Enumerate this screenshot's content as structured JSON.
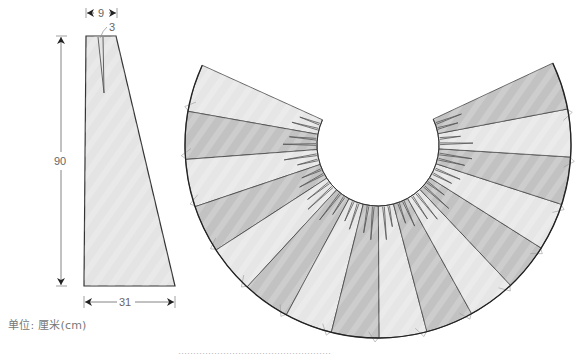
{
  "figure": {
    "type": "sewing-pattern",
    "unit_label": "单位: 厘米(cm)",
    "caption_clipped": "……………………………………………"
  },
  "front_piece": {
    "name": "tapered-panel",
    "dimensions": {
      "top_width": "9",
      "dart_width": "3",
      "height": "90",
      "bottom_width": "31"
    },
    "outline": [
      [
        86,
        36
      ],
      [
        116,
        36
      ],
      [
        175,
        286
      ],
      [
        84,
        286
      ]
    ],
    "dart": {
      "left": [
        98,
        37
      ],
      "right": [
        103,
        37
      ],
      "tip": [
        104,
        93
      ]
    },
    "fill": "#e4e4e4",
    "stroke": "#333333"
  },
  "skirt_fan": {
    "name": "circular-flared-skirt",
    "center": [
      378,
      145
    ],
    "inner_radius": 61,
    "outer_radius": 193,
    "start_angle_deg": 204.4,
    "end_angle_deg": -25.1,
    "panel_count": 16,
    "panel_colors": [
      "#e6e6e6",
      "#c2c2c2"
    ],
    "stroke": "#444444",
    "dart_color": "#555555"
  },
  "colors": {
    "dimension_line": "#888888",
    "text": "#666666",
    "background": "#ffffff"
  }
}
